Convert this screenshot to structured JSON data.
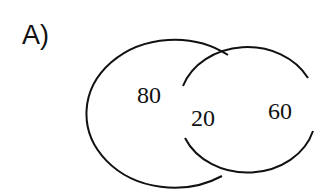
{
  "panel_label": "A)",
  "venn": {
    "left_set": {
      "value": "80"
    },
    "intersection": {
      "value": "20"
    },
    "right_set": {
      "value": "60"
    }
  },
  "colors": {
    "stroke": "#111111",
    "background": "#ffffff"
  }
}
